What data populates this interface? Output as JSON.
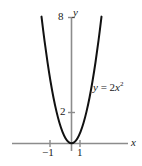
{
  "figure": {
    "background_color": "#ffffff",
    "width": 142,
    "height": 166
  },
  "chart_data": {
    "type": "line",
    "title": "",
    "subtitle": "",
    "xlabel": "x",
    "ylabel": "y",
    "xlim": [
      -2.05,
      1.95
    ],
    "ylim": [
      -0.25,
      8.8
    ],
    "grid": false,
    "legend_position": "inline-right",
    "annotations": [
      {
        "name": "curve-equation",
        "text": "y = 2x2",
        "text_plain": "y = 2x^2",
        "x": 1.45,
        "y": 4.1
      }
    ],
    "xticks": [
      -1,
      1
    ],
    "xticklabels": [
      "−1",
      "1"
    ],
    "yticks": [
      2,
      8
    ],
    "yticklabels": [
      "2",
      "8"
    ],
    "series": [
      {
        "name": "y = 2x2",
        "equation": "y = 2x^2",
        "coefficient_a": 2,
        "color": "#111111",
        "x": [
          -2.0,
          -1.8,
          -1.6,
          -1.4,
          -1.2,
          -1.0,
          -0.8,
          -0.6,
          -0.4,
          -0.2,
          0.0,
          0.2,
          0.4,
          0.6,
          0.8,
          1.0,
          1.2,
          1.4,
          1.6,
          1.8,
          2.0
        ],
        "values": [
          8.0,
          6.48,
          5.12,
          3.92,
          2.88,
          2.0,
          1.28,
          0.72,
          0.32,
          0.08,
          0.0,
          0.08,
          0.32,
          0.72,
          1.28,
          2.0,
          2.88,
          3.92,
          5.12,
          6.48,
          8.0
        ]
      }
    ],
    "key_points": [
      {
        "label": "vertex",
        "x": 0,
        "y": 0
      },
      {
        "label": "at x = -1",
        "x": -1,
        "y": 2
      },
      {
        "label": "at x = 1",
        "x": 1,
        "y": 2
      }
    ]
  },
  "labels": {
    "y_tick_8": "8",
    "y_tick_2": "2",
    "x_tick_neg1": "−1",
    "x_tick_1": "1",
    "axis_y_name": "y",
    "axis_x_name": "x",
    "curve_eq_var": "y",
    "curve_eq_equals": "=",
    "curve_eq_coeff": "2",
    "curve_eq_base": "x",
    "curve_eq_exponent": "2"
  },
  "colors": {
    "axis": "#8c8c8c",
    "curve": "#111111",
    "text": "#1a1a1a",
    "background": "#ffffff"
  }
}
